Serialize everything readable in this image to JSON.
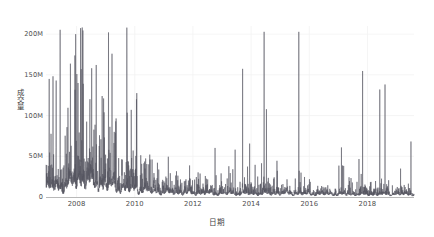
{
  "chart_data": {
    "type": "line",
    "title": "",
    "subtitle": "",
    "xlabel": "日期",
    "ylabel": "成交量",
    "x_tick_labels": [
      "2008",
      "2010",
      "2012",
      "2014",
      "2016",
      "2018"
    ],
    "x_tick_values": [
      2008,
      2010,
      2012,
      2014,
      2016,
      2018
    ],
    "y_tick_labels": [
      "0",
      "50M",
      "100M",
      "150M",
      "200M"
    ],
    "y_tick_values": [
      0,
      50000000,
      100000000,
      150000000,
      200000000
    ],
    "xlim": [
      2006.95,
      2019.6
    ],
    "ylim": [
      0,
      210000000
    ],
    "grid": true,
    "grid_color": "#f2f2f2",
    "legend": null,
    "legend_position": "none",
    "series": [
      {
        "name": "成交量",
        "color": "#55555f",
        "line_width": 0.55,
        "description": "每日成交量时间序列，2007-2019，2008年峰值约200M，其后逐年衰减至约5M基线",
        "annual_envelope": [
          {
            "year": 2007.0,
            "baseline": 12000000,
            "typical_peak": 60000000,
            "max_spike": 145000000
          },
          {
            "year": 2007.5,
            "baseline": 11000000,
            "typical_peak": 55000000,
            "max_spike": 143000000
          },
          {
            "year": 2008.0,
            "baseline": 20000000,
            "typical_peak": 110000000,
            "max_spike": 200000000
          },
          {
            "year": 2008.3,
            "baseline": 22000000,
            "typical_peak": 115000000,
            "max_spike": 157000000
          },
          {
            "year": 2008.6,
            "baseline": 15000000,
            "typical_peak": 70000000,
            "max_spike": 140000000
          },
          {
            "year": 2009.0,
            "baseline": 14000000,
            "typical_peak": 60000000,
            "max_spike": 124000000
          },
          {
            "year": 2009.5,
            "baseline": 11000000,
            "typical_peak": 40000000,
            "max_spike": 70000000
          },
          {
            "year": 2010.0,
            "baseline": 9000000,
            "typical_peak": 45000000,
            "max_spike": 120000000
          },
          {
            "year": 2010.5,
            "baseline": 7000000,
            "typical_peak": 30000000,
            "max_spike": 62000000
          },
          {
            "year": 2011.0,
            "baseline": 5500000,
            "typical_peak": 20000000,
            "max_spike": 35000000
          },
          {
            "year": 2012.0,
            "baseline": 4500000,
            "typical_peak": 14000000,
            "max_spike": 24000000
          },
          {
            "year": 2013.0,
            "baseline": 4000000,
            "typical_peak": 12000000,
            "max_spike": 22000000
          },
          {
            "year": 2014.0,
            "baseline": 3800000,
            "typical_peak": 11000000,
            "max_spike": 20000000
          },
          {
            "year": 2015.0,
            "baseline": 4000000,
            "typical_peak": 12000000,
            "max_spike": 27000000
          },
          {
            "year": 2016.0,
            "baseline": 3600000,
            "typical_peak": 10000000,
            "max_spike": 24000000
          },
          {
            "year": 2017.0,
            "baseline": 3000000,
            "typical_peak": 8000000,
            "max_spike": 15000000
          },
          {
            "year": 2018.0,
            "baseline": 3000000,
            "typical_peak": 8000000,
            "max_spike": 17000000
          },
          {
            "year": 2019.0,
            "baseline": 3200000,
            "typical_peak": 9000000,
            "max_spike": 28000000
          },
          {
            "year": 2019.5,
            "baseline": 3000000,
            "typical_peak": 7000000,
            "max_spike": 12000000
          }
        ]
      }
    ]
  },
  "axes": {
    "y_axis_name": "成交量",
    "x_axis_name": "日期",
    "axis_color": "#b8b8b8",
    "tick_text_color": "#4f4f4f"
  }
}
